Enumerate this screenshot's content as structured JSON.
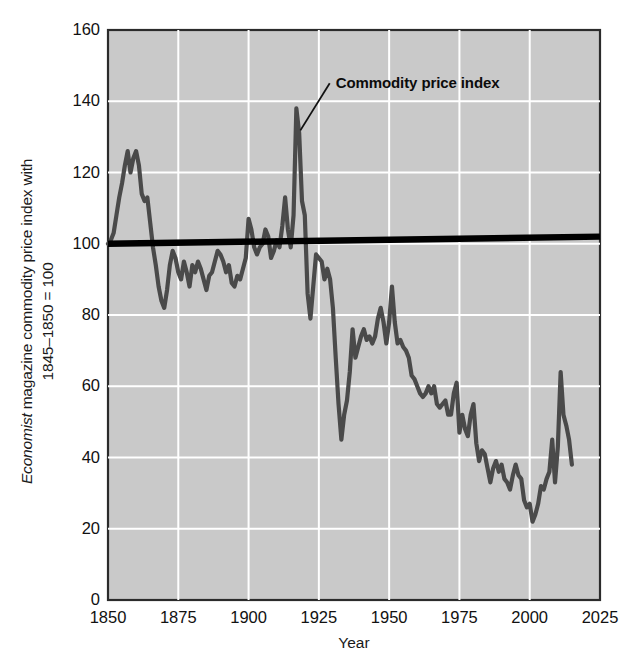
{
  "chart_data": {
    "type": "line",
    "title": "",
    "xlabel": "Year",
    "ylabel": "Economist magazine commodity price index with 1845-1850 = 100",
    "ylabel_part1_italic": "Economist",
    "ylabel_part1_rest": " magazine commodity price index with",
    "ylabel_part2": "1845–1850 = 100",
    "xlim": [
      1850,
      2025
    ],
    "ylim": [
      0,
      160
    ],
    "xticks": [
      1850,
      1875,
      1900,
      1925,
      1950,
      1975,
      2000,
      2025
    ],
    "yticks": [
      0,
      20,
      40,
      60,
      80,
      100,
      120,
      140,
      160
    ],
    "grid": true,
    "legend_position": "none",
    "plot_background": "#c9c9c9",
    "gridline_color": "#ffffff",
    "series_color": "#4a4a4a",
    "trend_color": "#000000",
    "annotations": [
      {
        "text": "Commodity price index",
        "target_x": 1917,
        "target_y": 138,
        "label_x": 1931,
        "label_y": 147
      }
    ],
    "series": [
      {
        "name": "Commodity price index",
        "x": [
          1850,
          1851,
          1852,
          1853,
          1854,
          1855,
          1856,
          1857,
          1858,
          1859,
          1860,
          1861,
          1862,
          1863,
          1864,
          1865,
          1866,
          1867,
          1868,
          1869,
          1870,
          1871,
          1872,
          1873,
          1874,
          1875,
          1876,
          1877,
          1878,
          1879,
          1880,
          1881,
          1882,
          1883,
          1884,
          1885,
          1886,
          1887,
          1888,
          1889,
          1890,
          1891,
          1892,
          1893,
          1894,
          1895,
          1896,
          1897,
          1898,
          1899,
          1900,
          1901,
          1902,
          1903,
          1904,
          1905,
          1906,
          1907,
          1908,
          1909,
          1910,
          1911,
          1912,
          1913,
          1914,
          1915,
          1916,
          1917,
          1918,
          1919,
          1920,
          1921,
          1922,
          1923,
          1924,
          1925,
          1926,
          1927,
          1928,
          1929,
          1930,
          1931,
          1932,
          1933,
          1934,
          1935,
          1936,
          1937,
          1938,
          1939,
          1940,
          1941,
          1942,
          1943,
          1944,
          1945,
          1946,
          1947,
          1948,
          1949,
          1950,
          1951,
          1952,
          1953,
          1954,
          1955,
          1956,
          1957,
          1958,
          1959,
          1960,
          1961,
          1962,
          1963,
          1964,
          1965,
          1966,
          1967,
          1968,
          1969,
          1970,
          1971,
          1972,
          1973,
          1974,
          1975,
          1976,
          1977,
          1978,
          1979,
          1980,
          1981,
          1982,
          1983,
          1984,
          1985,
          1986,
          1987,
          1988,
          1989,
          1990,
          1991,
          1992,
          1993,
          1994,
          1995,
          1996,
          1997,
          1998,
          1999,
          2000,
          2001,
          2002,
          2003,
          2004,
          2005,
          2006,
          2007,
          2008,
          2009,
          2010,
          2011,
          2012,
          2013,
          2014,
          2015
        ],
        "y": [
          100,
          101,
          103,
          108,
          113,
          117,
          122,
          126,
          120,
          124,
          126,
          122,
          114,
          112,
          113,
          106,
          99,
          94,
          88,
          84,
          82,
          87,
          94,
          98,
          96,
          92,
          90,
          95,
          92,
          88,
          94,
          92,
          95,
          93,
          90,
          87,
          91,
          92,
          95,
          98,
          97,
          95,
          92,
          94,
          89,
          88,
          91,
          90,
          93,
          96,
          107,
          104,
          99,
          97,
          99,
          100,
          104,
          102,
          96,
          98,
          101,
          99,
          105,
          113,
          104,
          99,
          108,
          138,
          131,
          112,
          108,
          86,
          79,
          88,
          97,
          96,
          95,
          90,
          93,
          90,
          82,
          68,
          55,
          45,
          52,
          56,
          64,
          76,
          68,
          71,
          74,
          76,
          73,
          74,
          72,
          74,
          79,
          82,
          78,
          72,
          78,
          88,
          78,
          72,
          73,
          71,
          70,
          68,
          63,
          62,
          60,
          58,
          57,
          58,
          60,
          58,
          60,
          55,
          54,
          55,
          56,
          52,
          52,
          58,
          61,
          47,
          52,
          48,
          46,
          52,
          55,
          44,
          39,
          42,
          41,
          37,
          33,
          37,
          39,
          36,
          38,
          34,
          33,
          31,
          35,
          38,
          35,
          34,
          28,
          26,
          27,
          22,
          24,
          27,
          32,
          31,
          34,
          36,
          45,
          33,
          43,
          64,
          52,
          49,
          45,
          38
        ]
      },
      {
        "name": "Trend line",
        "x": [
          1850,
          2025
        ],
        "y": [
          100,
          102
        ]
      }
    ]
  }
}
